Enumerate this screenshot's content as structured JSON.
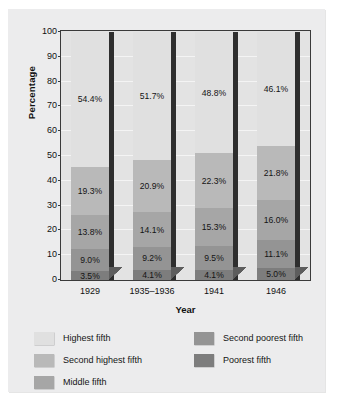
{
  "chart_data": {
    "type": "bar",
    "subtype": "stacked-bar-100-percent",
    "title": "",
    "xlabel": "Year",
    "ylabel": "Percentage",
    "ylim": [
      0,
      100
    ],
    "ytick_labels": [
      "0",
      "10",
      "20",
      "30",
      "40",
      "50",
      "60",
      "70",
      "80",
      "90",
      "100"
    ],
    "ytick_values": [
      0,
      10,
      20,
      30,
      40,
      50,
      60,
      70,
      80,
      90,
      100
    ],
    "grid": true,
    "legend_position": "bottom",
    "categories": [
      "1929",
      "1935–1936",
      "1941",
      "1946"
    ],
    "series": [
      {
        "name": "Poorest fifth",
        "color": "#7d7d7d",
        "values": [
          3.5,
          4.1,
          4.1,
          5.0
        ],
        "labels": [
          "3.5%",
          "4.1%",
          "4.1%",
          "5.0%"
        ]
      },
      {
        "name": "Second poorest fifth",
        "color": "#949494",
        "values": [
          9.0,
          9.2,
          9.5,
          11.1
        ],
        "labels": [
          "9.0%",
          "9.2%",
          "9.5%",
          "11.1%"
        ]
      },
      {
        "name": "Middle fifth",
        "color": "#a6a6a6",
        "values": [
          13.8,
          14.1,
          15.3,
          16.0
        ],
        "labels": [
          "13.8%",
          "14.1%",
          "15.3%",
          "16.0%"
        ]
      },
      {
        "name": "Second highest fifth",
        "color": "#b9b9b9",
        "values": [
          19.3,
          20.9,
          22.3,
          21.8
        ],
        "labels": [
          "19.3%",
          "20.9%",
          "22.3%",
          "21.8%"
        ]
      },
      {
        "name": "Highest fifth",
        "color": "#e0e0e0",
        "values": [
          54.4,
          51.7,
          48.8,
          46.1
        ],
        "labels": [
          "54.4%",
          "51.7%",
          "48.8%",
          "46.1%"
        ]
      }
    ]
  },
  "legend": {
    "left_column": [
      {
        "label": "Highest fifth",
        "color": "#e0e0e0"
      },
      {
        "label": "Second highest fifth",
        "color": "#b9b9b9"
      },
      {
        "label": "Middle fifth",
        "color": "#a6a6a6"
      }
    ],
    "right_column": [
      {
        "label": "Second poorest fifth",
        "color": "#949494"
      },
      {
        "label": "Poorest fifth",
        "color": "#7d7d7d"
      }
    ]
  },
  "colors": {
    "panel_background": "#ececed",
    "plot_background": "#e3e3e3",
    "axis_line": "#3a3a3a",
    "gridline": "#f4f4f4",
    "bar_side_face": "#2e2e2e",
    "text": "#141414"
  }
}
